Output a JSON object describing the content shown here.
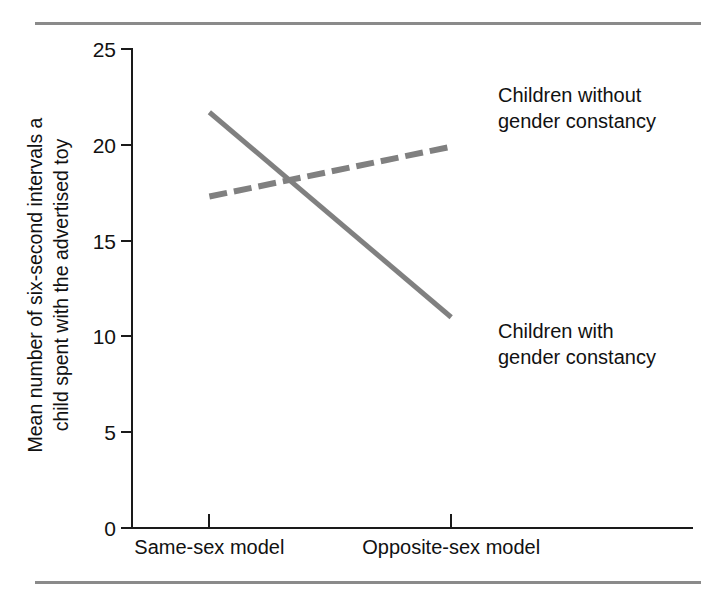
{
  "figure": {
    "width": 724,
    "height": 599,
    "background": "#ffffff",
    "rule_color": "#8a8a8a",
    "axis_color": "#1a1a1a",
    "series_color": "#808080"
  },
  "chart_data": {
    "type": "line",
    "title": "",
    "subtitle": "",
    "xlabel": "",
    "ylabel": "Mean number of six-second intervals a child spent with the advertised toy",
    "ylabel_lines": [
      "Mean number of six-second intervals a",
      "child spent with the advertised toy"
    ],
    "categories": [
      "Same-sex model",
      "Opposite-sex model"
    ],
    "x": [
      0,
      1
    ],
    "xtick_labels": [
      "Same-sex model",
      "Opposite-sex model"
    ],
    "ytick_labels": [
      "0",
      "5",
      "10",
      "15",
      "20",
      "25"
    ],
    "yticks": [
      0,
      5,
      10,
      15,
      20,
      25
    ],
    "ylim": [
      0,
      25
    ],
    "xlim": [
      -0.32,
      2.0
    ],
    "grid": false,
    "legend_position": "inline-annotations",
    "series": [
      {
        "name": "Children with gender constancy",
        "values": [
          21.7,
          11.0
        ],
        "style": "solid",
        "color": "#808080",
        "width": 5
      },
      {
        "name": "Children without gender constancy",
        "values": [
          17.3,
          19.9
        ],
        "style": "dashed",
        "color": "#808080",
        "width": 6,
        "dash_pattern": "18 7"
      }
    ],
    "annotations": [
      {
        "id": "without",
        "text": "Children without gender constancy",
        "lines": [
          "Children without",
          "gender constancy"
        ]
      },
      {
        "id": "with",
        "text": "Children with gender constancy",
        "lines": [
          "Children with",
          "gender constancy"
        ]
      }
    ]
  }
}
